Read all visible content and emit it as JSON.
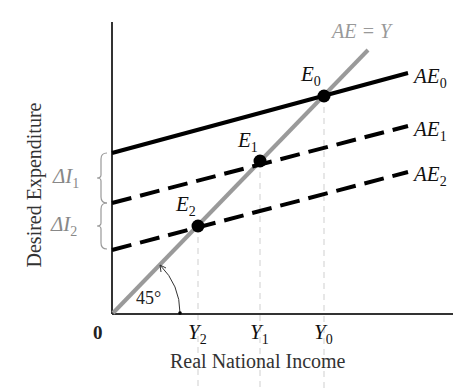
{
  "diagram": {
    "title": "",
    "x_axis_label": "Real National Income",
    "y_axis_label": "Desired Expenditure",
    "origin_label": "0",
    "angle_label": "45°",
    "lines": {
      "forty_five": {
        "label": "AE = Y",
        "color": "#9a9a9a"
      },
      "ae0": {
        "label": "AE",
        "sub": "0",
        "style": "solid",
        "color": "#000000"
      },
      "ae1": {
        "label": "AE",
        "sub": "1",
        "style": "dashed",
        "color": "#000000"
      },
      "ae2": {
        "label": "AE",
        "sub": "2",
        "style": "dashed",
        "color": "#000000"
      }
    },
    "equilibria": [
      {
        "label": "E",
        "sub": "0"
      },
      {
        "label": "E",
        "sub": "1"
      },
      {
        "label": "E",
        "sub": "2"
      }
    ],
    "x_ticks": [
      {
        "label": "Y",
        "sub": "2"
      },
      {
        "label": "Y",
        "sub": "1"
      },
      {
        "label": "Y",
        "sub": "0"
      }
    ],
    "brackets": [
      {
        "label": "ΔI",
        "sub": "1"
      },
      {
        "label": "ΔI",
        "sub": "2"
      }
    ]
  }
}
